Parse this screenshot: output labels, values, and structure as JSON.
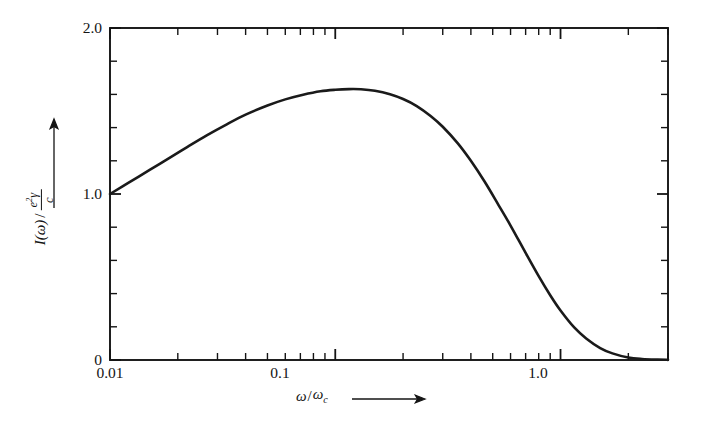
{
  "figure": {
    "background_color": "#ffffff",
    "ink_color": "#141414",
    "curve_color": "#1a1a1a"
  },
  "axes": {
    "y_label_parts": {
      "intensity": "I(ω)",
      "slash": "/",
      "numerator_e": "e",
      "numerator_exp": "2",
      "numerator_gamma": "γ",
      "denominator": "c"
    },
    "x_label_parts": {
      "omega": "ω",
      "slash": "/",
      "omega_c_base": "ω",
      "omega_c_sub": "c"
    },
    "y_tick_labels": [
      "2.0",
      "1.0",
      "0"
    ],
    "x_tick_labels": [
      "0.01",
      "0.1",
      "1.0"
    ]
  },
  "chart_data": {
    "type": "line",
    "title": "",
    "subtitle": "",
    "xlabel": "ω/ω_c",
    "ylabel": "I(ω) / (e²γ/c)",
    "xscale": "log",
    "yscale": "linear",
    "xlim": [
      0.01,
      3.0
    ],
    "ylim": [
      0.0,
      2.0
    ],
    "grid": false,
    "legend": null,
    "x_major_ticks": [
      0.01,
      0.1,
      1.0
    ],
    "x_major_tick_labels": [
      "0.01",
      "0.1",
      "1.0"
    ],
    "x_minor_ticks": [
      0.02,
      0.03,
      0.04,
      0.05,
      0.06,
      0.07,
      0.08,
      0.09,
      0.2,
      0.3,
      0.4,
      0.5,
      0.6,
      0.7,
      0.8,
      0.9,
      2.0,
      3.0
    ],
    "y_major_ticks": [
      0,
      1.0,
      2.0
    ],
    "y_minor_ticks": [
      0.2,
      0.4,
      0.6,
      0.8,
      1.2,
      1.4,
      1.6,
      1.8
    ],
    "series": [
      {
        "name": "synchrotron-spectrum",
        "color": "#1a1a1a",
        "line_width_px": 2.6,
        "x": [
          0.01,
          0.012,
          0.015,
          0.018,
          0.022,
          0.027,
          0.033,
          0.04,
          0.05,
          0.06,
          0.072,
          0.086,
          0.1,
          0.115,
          0.13,
          0.15,
          0.175,
          0.2,
          0.23,
          0.265,
          0.3,
          0.35,
          0.4,
          0.46,
          0.53,
          0.6,
          0.7,
          0.8,
          0.9,
          1.0,
          1.15,
          1.3,
          1.5,
          1.7,
          2.0,
          2.3,
          2.7,
          3.0
        ],
        "y": [
          1.0,
          1.065,
          1.145,
          1.21,
          1.283,
          1.355,
          1.42,
          1.478,
          1.533,
          1.57,
          1.598,
          1.619,
          1.628,
          1.632,
          1.631,
          1.622,
          1.601,
          1.572,
          1.53,
          1.47,
          1.405,
          1.305,
          1.2,
          1.075,
          0.935,
          0.81,
          0.645,
          0.505,
          0.39,
          0.298,
          0.196,
          0.13,
          0.072,
          0.04,
          0.015,
          0.006,
          0.002,
          0.001
        ]
      }
    ]
  },
  "geometry": {
    "plot_left_px": 110,
    "plot_right_px": 668,
    "plot_top_px": 28,
    "plot_bottom_px": 360,
    "frame_width_px": 1.9,
    "tick_length_major_px": 11,
    "tick_length_minor_px": 7
  }
}
